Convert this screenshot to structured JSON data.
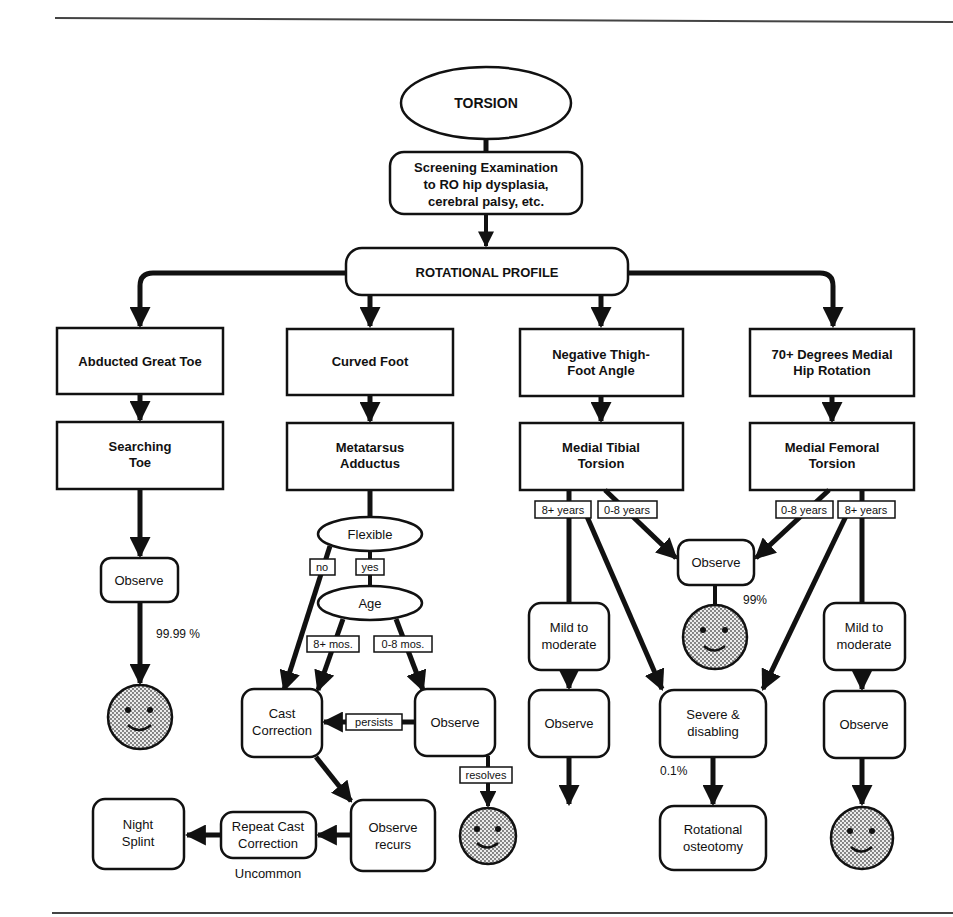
{
  "title": "TORSION",
  "screening": {
    "line1": "Screening Examination",
    "line2": "to RO hip dysplasia,",
    "line3": "cerebral palsy, etc."
  },
  "profile": "ROTATIONAL PROFILE",
  "columns": [
    {
      "finding": [
        "Abducted Great Toe"
      ],
      "diagnosis": [
        "Searching",
        "Toe"
      ]
    },
    {
      "finding": [
        "Curved Foot"
      ],
      "diagnosis": [
        "Metatarsus",
        "Adductus"
      ]
    },
    {
      "finding": [
        "Negative Thigh-",
        "Foot Angle"
      ],
      "diagnosis": [
        "Medial Tibial",
        "Torsion"
      ]
    },
    {
      "finding": [
        "70+ Degrees Medial",
        "Hip Rotation"
      ],
      "diagnosis": [
        "Medial Femoral",
        "Torsion"
      ]
    }
  ],
  "toe_branch": {
    "observe": "Observe",
    "outcome": "99.99 %"
  },
  "foot_branch": {
    "flexible": "Flexible",
    "no": "no",
    "yes": "yes",
    "age": "Age",
    "older": "8+ mos.",
    "younger": "0-8 mos.",
    "cast": [
      "Cast",
      "Correction"
    ],
    "persists": "persists",
    "observe": "Observe",
    "resolves": "resolves",
    "observe_recurs": [
      "Observe",
      "recurs"
    ],
    "repeat_cast": [
      "Repeat Cast",
      "Correction"
    ],
    "uncommon": "Uncommon",
    "night_splint": [
      "Night",
      "Splint"
    ]
  },
  "torsion_branch": {
    "tibial_older": "8+ years",
    "tibial_younger": "0-8 years",
    "femoral_younger": "0-8 years",
    "femoral_older": "8+ years",
    "observe_center": "Observe",
    "center_outcome": "99%",
    "mild_left": [
      "Mild to",
      "moderate"
    ],
    "mild_right": [
      "Mild to",
      "moderate"
    ],
    "observe_left": "Observe",
    "observe_right": "Observe",
    "severe": [
      "Severe &",
      "disabling"
    ],
    "severe_pct": "0.1%",
    "osteotomy": [
      "Rotational",
      "osteotomy"
    ]
  },
  "colors": {
    "ink": "#111111",
    "paper": "#ffffff",
    "face_fill": "#d4d4d4"
  }
}
